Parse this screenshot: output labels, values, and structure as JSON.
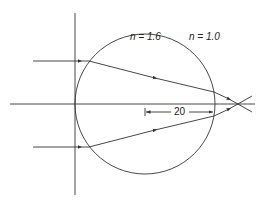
{
  "diagram": {
    "type": "ray-optics",
    "labels": {
      "inner_index": "n = 1.6",
      "outer_index": "n = 1.0",
      "dimension": "20"
    },
    "colors": {
      "stroke": "#333333",
      "background": "#ffffff"
    }
  }
}
